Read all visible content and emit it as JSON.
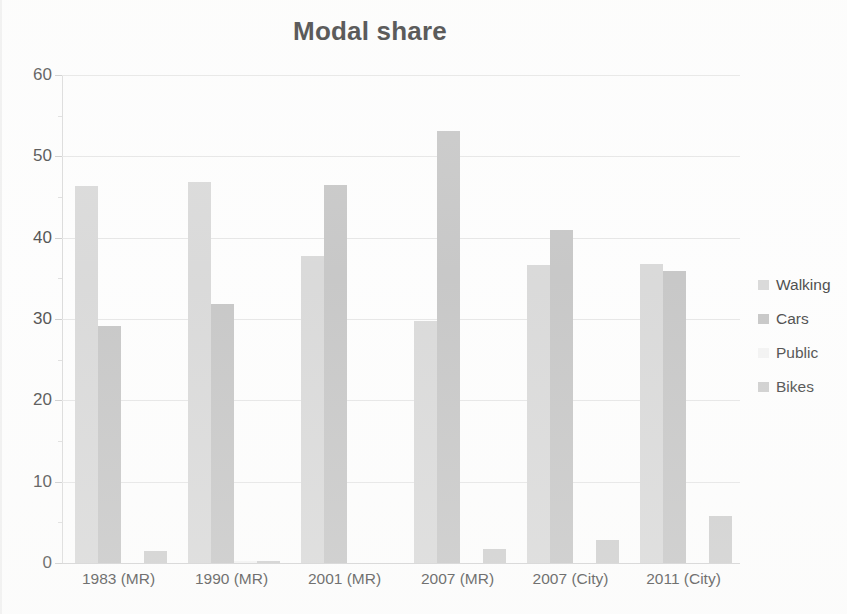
{
  "chart_data": {
    "type": "bar",
    "title": "Modal share",
    "xlabel": "",
    "ylabel": "",
    "ylim": [
      0,
      60
    ],
    "ytick_step": 10,
    "yticks": [
      0,
      10,
      20,
      30,
      40,
      50,
      60
    ],
    "grid": true,
    "legend_position": "right",
    "categories": [
      "1983 (MR)",
      "1990 (MR)",
      "2001 (MR)",
      "2007 (MR)",
      "2007 (City)",
      "2011 (City)"
    ],
    "series": [
      {
        "name": "Walking",
        "color": "#d6d6d6",
        "values": [
          46.4,
          46.8,
          37.7,
          29.8,
          36.7,
          36.8
        ]
      },
      {
        "name": "Cars",
        "color": "#c2c2c2",
        "values": [
          29.2,
          31.9,
          46.5,
          53.1,
          40.9,
          35.9
        ]
      },
      {
        "name": "Public",
        "color": "#f2f2f2",
        "values": [
          0.0,
          0.2,
          0.0,
          0.0,
          0.0,
          0.0
        ]
      },
      {
        "name": "Bikes",
        "color": "#cbcbcb",
        "values": [
          1.5,
          0.3,
          0.0,
          1.7,
          2.8,
          5.8
        ]
      }
    ]
  },
  "legend": {
    "items": [
      {
        "label": "Walking"
      },
      {
        "label": "Cars"
      },
      {
        "label": "Public"
      },
      {
        "label": "Bikes"
      }
    ]
  },
  "axis": {
    "y_tick_labels": [
      "60",
      "50",
      "40",
      "30",
      "20",
      "10",
      "0"
    ],
    "x_tick_labels": [
      "1983 (MR)",
      "1990 (MR)",
      "2001 (MR)",
      "2007 (MR)",
      "2007 (City)",
      "2011 (City)"
    ]
  },
  "colors": {
    "background": "#fdfdfd",
    "gridline": "#e4e4e4",
    "axis": "#d8d8d8",
    "text": "#3b3b3b",
    "title": "#2b2b2b"
  }
}
